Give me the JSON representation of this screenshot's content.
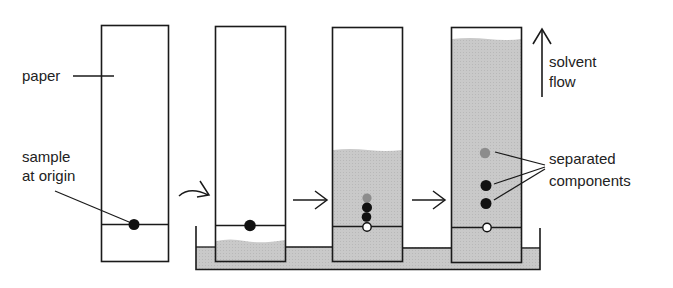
{
  "figure": {
    "colors": {
      "ink": "#1a1a1a",
      "solvent": "#c8c8c8",
      "faint_spot": "#8c8c8c",
      "paper": "#ffffff"
    }
  },
  "labels": {
    "paper": "paper",
    "sample_line1": "sample",
    "sample_line2": "at origin",
    "solvent_line1": "solvent",
    "solvent_line2": "flow",
    "separated_line1": "separated",
    "separated_line2": "components"
  },
  "stages": [
    {
      "name": "dry paper with sample spot",
      "solvent_level": "none",
      "spots": [
        "black-origin"
      ]
    },
    {
      "name": "paper placed in solvent",
      "solvent_level": "below origin",
      "spots": [
        "black-origin"
      ]
    },
    {
      "name": "solvent rising",
      "solvent_level": "partial",
      "spots": [
        "grey",
        "black",
        "black",
        "hollow-origin"
      ]
    },
    {
      "name": "separation complete",
      "solvent_level": "near top",
      "spots": [
        "grey",
        "black",
        "black",
        "hollow-origin"
      ]
    }
  ]
}
